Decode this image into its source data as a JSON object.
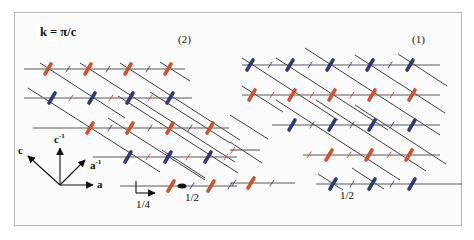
{
  "figure": {
    "wavevector_label": "k = π/c",
    "panels": [
      {
        "id": "left",
        "label": "(2)"
      },
      {
        "id": "right",
        "label": "(1)"
      }
    ],
    "axes": {
      "a": "a",
      "c": "c",
      "a_inv": "a",
      "a_inv_sup": "-1",
      "c_inv": "c",
      "c_inv_sup": "-1"
    },
    "annotations": {
      "quarter": "1/4",
      "half_left": "1/2",
      "half_right": "1/2"
    },
    "colors": {
      "red": "#d0502f",
      "blue": "#2e3a7a",
      "line": "#5a5a5a",
      "diag": "#2a2a2a",
      "frame": "#b9b9b9"
    }
  }
}
